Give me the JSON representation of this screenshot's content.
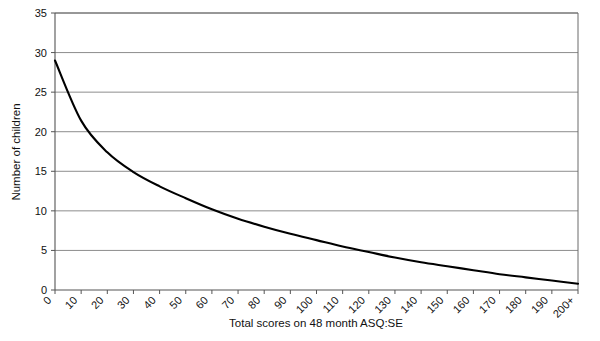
{
  "chart_data": {
    "type": "line",
    "title": "",
    "subtitle": "",
    "xlabel": "Total scores on 48 month ASQ:SE",
    "ylabel": "Number of children",
    "categories": [
      "0",
      "10",
      "20",
      "30",
      "40",
      "50",
      "60",
      "70",
      "80",
      "90",
      "100",
      "110",
      "120",
      "130",
      "140",
      "150",
      "160",
      "170",
      "180",
      "190",
      "200+"
    ],
    "values": [
      29.0,
      21.4,
      17.4,
      14.9,
      13.1,
      11.6,
      10.2,
      9.0,
      8.0,
      7.1,
      6.3,
      5.5,
      4.8,
      4.1,
      3.5,
      3.0,
      2.5,
      2.0,
      1.6,
      1.2,
      0.8
    ],
    "series": [
      {
        "name": "Number of children",
        "values": [
          29.0,
          21.4,
          17.4,
          14.9,
          13.1,
          11.6,
          10.2,
          9.0,
          8.0,
          7.1,
          6.3,
          5.5,
          4.8,
          4.1,
          3.5,
          3.0,
          2.5,
          2.0,
          1.6,
          1.2,
          0.8
        ]
      }
    ],
    "ylim": [
      0,
      35
    ],
    "yticks": [
      0,
      5,
      10,
      15,
      20,
      25,
      30,
      35
    ],
    "ytick_labels": [
      "0",
      "5",
      "10",
      "15",
      "20",
      "25",
      "30",
      "35"
    ],
    "grid": "horizontal",
    "legend": "none",
    "line_color": "#000000",
    "grid_color": "#808080",
    "axis_color": "#555555",
    "background_color": "#ffffff",
    "xtick_label_rotation": -45
  },
  "axes": {
    "x_title": "Total scores on 48 month ASQ:SE",
    "y_title": "Number of children"
  }
}
